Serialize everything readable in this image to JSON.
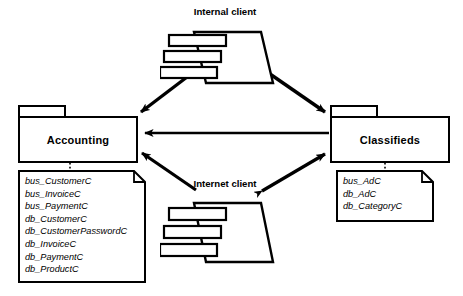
{
  "diagram": {
    "type": "uml-package-diagram",
    "background_color": "#ffffff",
    "stroke_color": "#000000"
  },
  "packages": [
    {
      "id": "accounting",
      "label": "Accounting",
      "x": 18,
      "y": 105,
      "width": 120,
      "height": 58
    },
    {
      "id": "classifieds",
      "label": "Classifieds",
      "x": 330,
      "y": 105,
      "width": 120,
      "height": 58
    }
  ],
  "notes": [
    {
      "id": "accounting-note",
      "attached_to": "accounting",
      "x": 18,
      "y": 170,
      "width": 128,
      "height": 113,
      "items": [
        "bus_CustomerC",
        "bus_InvoiceC",
        "bus_PaymentC",
        "db_CustomerC",
        "db_CustomerPasswordC",
        "db_InvoiceC",
        "db_PaymentC",
        "db_ProductC"
      ]
    },
    {
      "id": "classifieds-note",
      "attached_to": "classifieds",
      "x": 336,
      "y": 170,
      "width": 98,
      "height": 52,
      "items": [
        "bus_AdC",
        "db_AdC",
        "db_CategoryC"
      ]
    }
  ],
  "clients": [
    {
      "id": "internal-client",
      "label": "Internal client",
      "x": 160,
      "y": 6,
      "width": 130,
      "height": 88
    },
    {
      "id": "internet-client",
      "label": "Internet client",
      "x": 160,
      "y": 178,
      "width": 130,
      "height": 110
    }
  ],
  "connections": [
    {
      "id": "internal-to-accounting",
      "from": "internal-client",
      "to": "accounting",
      "style": "solid",
      "arrow": "single",
      "direction": "down-left"
    },
    {
      "id": "internal-to-classifieds",
      "from": "internal-client",
      "to": "classifieds",
      "style": "solid",
      "arrow": "single",
      "direction": "down-right"
    },
    {
      "id": "classifieds-to-accounting",
      "from": "classifieds",
      "to": "accounting",
      "style": "solid",
      "arrow": "single",
      "direction": "left"
    },
    {
      "id": "internet-to-accounting",
      "from": "internet-client",
      "to": "accounting",
      "style": "solid",
      "arrow": "single",
      "direction": "up-left"
    },
    {
      "id": "internet-classifieds-bidirectional",
      "from": "internet-client",
      "to": "classifieds",
      "style": "solid",
      "arrow": "double",
      "direction": "up-right"
    },
    {
      "id": "accounting-note-link",
      "from": "accounting",
      "to": "accounting-note",
      "style": "dotted",
      "arrow": "none",
      "direction": "down"
    },
    {
      "id": "classifieds-note-link",
      "from": "classifieds",
      "to": "classifieds-note",
      "style": "dotted",
      "arrow": "none",
      "direction": "down"
    }
  ]
}
